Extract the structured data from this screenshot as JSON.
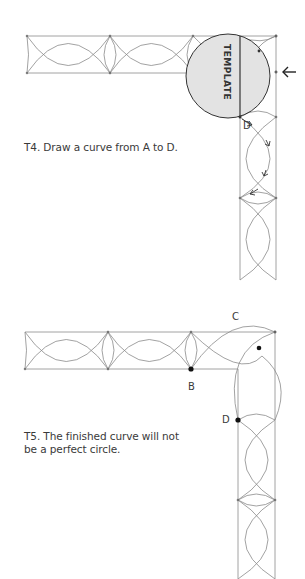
{
  "figure_t4": {
    "template_label": "TEMPLATE",
    "point_label_d": "D",
    "caption": "T4. Draw a curve from A to D.",
    "arrow_glyph": "←"
  },
  "figure_t5": {
    "point_label_b": "B",
    "point_label_c": "C",
    "point_label_d": "D",
    "caption_line1": "T5. The finished curve will not",
    "caption_line2": "be a perfect circle."
  },
  "colors": {
    "line": "#8a8a8a",
    "dark_line": "#333333",
    "template_fill": "#e3e3e3"
  }
}
